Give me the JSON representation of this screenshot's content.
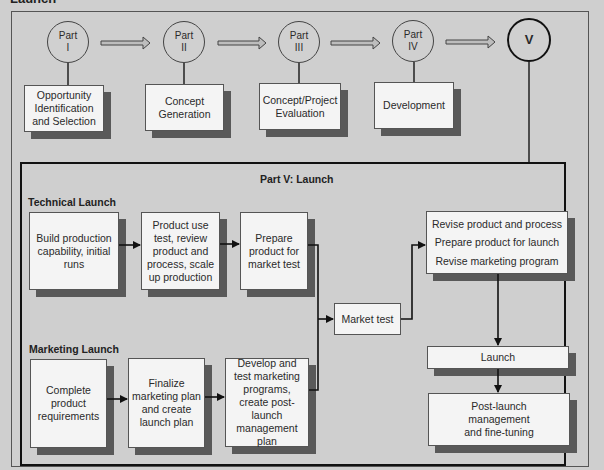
{
  "header": {
    "title": "Launch"
  },
  "overview": {
    "parts": [
      {
        "label": "Part",
        "numeral": "I",
        "box": "Opportunity Identification and Selection"
      },
      {
        "label": "Part",
        "numeral": "II",
        "box": "Concept Generation"
      },
      {
        "label": "Part",
        "numeral": "III",
        "box": "Concept/Project Evaluation"
      },
      {
        "label": "Part",
        "numeral": "IV",
        "box": "Development"
      },
      {
        "label": "",
        "numeral": "V",
        "box": ""
      }
    ]
  },
  "detail": {
    "title": "Part V: Launch",
    "technical": {
      "heading": "Technical Launch",
      "steps": [
        "Build production capability, initial runs",
        "Product use test, review product and process, scale up production",
        "Prepare product for market test"
      ]
    },
    "marketing": {
      "heading": "Marketing Launch",
      "steps": [
        "Complete product requirements",
        "Finalize marketing plan and create launch plan",
        "Develop and test marketing programs, create post-launch management plan"
      ]
    },
    "market_test": "Market test",
    "revise": [
      "Revise product and process",
      "Prepare product for launch",
      "Revise marketing program"
    ],
    "launch": "Launch",
    "post_launch": "Post-launch management and fine-tuning"
  }
}
